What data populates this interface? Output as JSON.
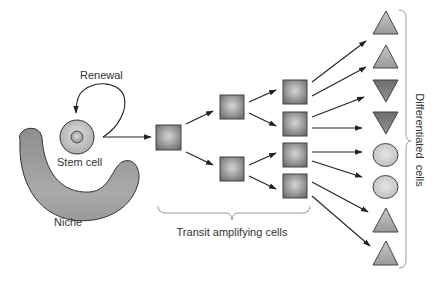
{
  "diagram": {
    "labels": {
      "renewal": "Renewal",
      "stem_cell": "Stem cell",
      "niche": "Niche",
      "transit_amplifying": "Transit amplifying cells",
      "differentiated": "Differentiated  cells"
    },
    "colors": {
      "stroke": "#333333",
      "niche_fill": "#9a9a9a",
      "stem_fill": "#c8c8c8",
      "square_fill": "#8c8c8c",
      "triangle_up_fill": "#a9a9a9",
      "triangle_down_fill": "#7e7e7e",
      "oval_fill": "#cfcfcf",
      "brace": "#999999"
    },
    "stages": [
      {
        "name": "stem-cell",
        "count": 1
      },
      {
        "name": "transit-generation-1",
        "count": 1
      },
      {
        "name": "transit-generation-2",
        "count": 2
      },
      {
        "name": "transit-generation-3",
        "count": 4
      },
      {
        "name": "differentiated",
        "count": 8
      }
    ],
    "differentiated_cells": [
      {
        "shape": "triangle-up"
      },
      {
        "shape": "triangle-up"
      },
      {
        "shape": "triangle-down"
      },
      {
        "shape": "triangle-down"
      },
      {
        "shape": "oval"
      },
      {
        "shape": "oval"
      },
      {
        "shape": "triangle-up"
      },
      {
        "shape": "triangle-up"
      }
    ]
  }
}
